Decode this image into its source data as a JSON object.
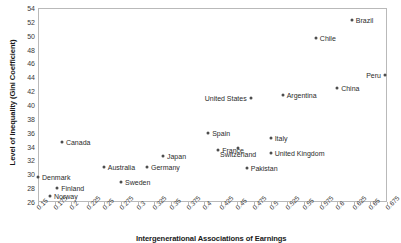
{
  "chart_data": {
    "type": "scatter",
    "title": "",
    "xlabel": "Intergenerational Associations of Earnings",
    "ylabel": "Level of Inequality (Gini Coefficient)",
    "xlim": [
      0.15,
      0.675
    ],
    "ylim": [
      26,
      54
    ],
    "grid": false,
    "legend": "none",
    "xticks": [
      "0.15",
      "0.175",
      "0.2",
      "0.225",
      "0.25",
      "0.275",
      "0.3",
      "0.325",
      "0.35",
      "0.375",
      "0.4",
      "0.425",
      "0.45",
      "0.475",
      "0.5",
      "0.525",
      "0.55",
      "0.575",
      "0.6",
      "0.625",
      "0.65",
      "0.675"
    ],
    "yticks": [
      "26",
      "28",
      "30",
      "32",
      "34",
      "36",
      "38",
      "40",
      "42",
      "44",
      "46",
      "48",
      "50",
      "52",
      "54"
    ],
    "points": [
      {
        "label": "Denmark",
        "x": 0.15,
        "y": 29.6,
        "label_pos": "right"
      },
      {
        "label": "Finland",
        "x": 0.179,
        "y": 28.0,
        "label_pos": "right"
      },
      {
        "label": "Norway",
        "x": 0.168,
        "y": 26.8,
        "label_pos": "right"
      },
      {
        "label": "Canada",
        "x": 0.186,
        "y": 34.6,
        "label_pos": "right"
      },
      {
        "label": "Australia",
        "x": 0.249,
        "y": 31.1,
        "label_pos": "right"
      },
      {
        "label": "Sweden",
        "x": 0.275,
        "y": 28.9,
        "label_pos": "right"
      },
      {
        "label": "Germany",
        "x": 0.314,
        "y": 31.0,
        "label_pos": "right"
      },
      {
        "label": "Japan",
        "x": 0.338,
        "y": 32.6,
        "label_pos": "right"
      },
      {
        "label": "Spain",
        "x": 0.406,
        "y": 35.9,
        "label_pos": "right"
      },
      {
        "label": "France",
        "x": 0.421,
        "y": 33.5,
        "label_pos": "right"
      },
      {
        "label": "Switzerland",
        "x": 0.451,
        "y": 33.8,
        "label_pos": "below"
      },
      {
        "label": "Pakistan",
        "x": 0.464,
        "y": 30.9,
        "label_pos": "right"
      },
      {
        "label": "United States",
        "x": 0.47,
        "y": 41.0,
        "label_pos": "left"
      },
      {
        "label": "Italy",
        "x": 0.5,
        "y": 35.2,
        "label_pos": "right"
      },
      {
        "label": "United Kingdom",
        "x": 0.5,
        "y": 33.1,
        "label_pos": "right"
      },
      {
        "label": "Argentina",
        "x": 0.518,
        "y": 41.4,
        "label_pos": "right"
      },
      {
        "label": "Chile",
        "x": 0.568,
        "y": 49.6,
        "label_pos": "right"
      },
      {
        "label": "China",
        "x": 0.6,
        "y": 42.4,
        "label_pos": "right"
      },
      {
        "label": "Brazil",
        "x": 0.622,
        "y": 52.3,
        "label_pos": "right"
      },
      {
        "label": "Peru",
        "x": 0.672,
        "y": 44.4,
        "label_pos": "left"
      }
    ]
  }
}
